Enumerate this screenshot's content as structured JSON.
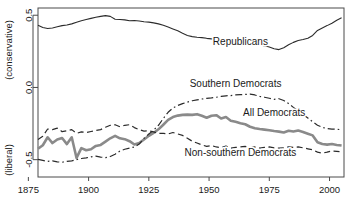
{
  "chart_data": {
    "type": "line",
    "title": "",
    "xlabel": "",
    "ylabel": "",
    "y_axis_top_label": "(conservative)",
    "y_axis_bottom_label": "(liberal)",
    "xlim": [
      1879,
      2006
    ],
    "ylim": [
      -0.62,
      0.55
    ],
    "grid": false,
    "legend_position": "inline-annotations",
    "xticks": [
      1875,
      1900,
      1925,
      1950,
      1975,
      2000
    ],
    "xtick_labels": [
      "1875",
      "1900",
      "1925",
      "1950",
      "1975",
      "2000"
    ],
    "yticks": [
      0.5,
      0.0,
      -0.5
    ],
    "ytick_labels": [
      "0.5",
      "0.0",
      "-0.5"
    ],
    "series": [
      {
        "name": "Republicans",
        "label": "Republicans",
        "style": "solid",
        "color": "#2b2b2b",
        "width": 1.1,
        "label_x": 1963,
        "label_y": 0.295,
        "x": [
          1879,
          1881,
          1883,
          1885,
          1887,
          1889,
          1891,
          1893,
          1895,
          1897,
          1899,
          1901,
          1903,
          1905,
          1907,
          1909,
          1911,
          1913,
          1915,
          1917,
          1919,
          1921,
          1923,
          1925,
          1927,
          1929,
          1931,
          1933,
          1935,
          1937,
          1939,
          1941,
          1943,
          1945,
          1947,
          1949,
          1951,
          1953,
          1955,
          1957,
          1959,
          1961,
          1963,
          1965,
          1967,
          1969,
          1971,
          1973,
          1975,
          1977,
          1979,
          1981,
          1983,
          1985,
          1987,
          1989,
          1991,
          1993,
          1995,
          1997,
          1999,
          2001,
          2003,
          2005
        ],
        "y": [
          0.43,
          0.415,
          0.408,
          0.412,
          0.42,
          0.428,
          0.432,
          0.44,
          0.452,
          0.462,
          0.47,
          0.478,
          0.486,
          0.492,
          0.497,
          0.492,
          0.472,
          0.47,
          0.468,
          0.462,
          0.463,
          0.46,
          0.455,
          0.452,
          0.447,
          0.44,
          0.43,
          0.418,
          0.405,
          0.392,
          0.375,
          0.36,
          0.352,
          0.348,
          0.345,
          0.34,
          0.336,
          0.332,
          0.33,
          0.328,
          0.326,
          0.322,
          0.318,
          0.312,
          0.305,
          0.3,
          0.295,
          0.288,
          0.28,
          0.268,
          0.262,
          0.275,
          0.295,
          0.312,
          0.325,
          0.332,
          0.34,
          0.36,
          0.395,
          0.412,
          0.428,
          0.445,
          0.465,
          0.482
        ]
      },
      {
        "name": "All Democrats",
        "label": "All Democrats",
        "style": "solid",
        "color": "#8a8a8a",
        "width": 2.6,
        "label_x": 1977,
        "label_y": -0.195,
        "x": [
          1879,
          1881,
          1883,
          1885,
          1887,
          1889,
          1891,
          1893,
          1895,
          1897,
          1899,
          1901,
          1903,
          1905,
          1907,
          1909,
          1911,
          1913,
          1915,
          1917,
          1919,
          1921,
          1923,
          1925,
          1927,
          1929,
          1931,
          1933,
          1935,
          1937,
          1939,
          1941,
          1943,
          1945,
          1947,
          1949,
          1951,
          1953,
          1955,
          1957,
          1959,
          1961,
          1963,
          1965,
          1967,
          1969,
          1971,
          1973,
          1975,
          1977,
          1979,
          1981,
          1983,
          1985,
          1987,
          1989,
          1991,
          1993,
          1995,
          1997,
          1999,
          2001,
          2003,
          2005
        ],
        "y": [
          -0.425,
          -0.4,
          -0.345,
          -0.385,
          -0.36,
          -0.35,
          -0.392,
          -0.345,
          -0.488,
          -0.42,
          -0.435,
          -0.428,
          -0.405,
          -0.398,
          -0.375,
          -0.352,
          -0.335,
          -0.352,
          -0.358,
          -0.372,
          -0.395,
          -0.385,
          -0.36,
          -0.335,
          -0.315,
          -0.29,
          -0.258,
          -0.225,
          -0.205,
          -0.195,
          -0.19,
          -0.188,
          -0.19,
          -0.185,
          -0.196,
          -0.21,
          -0.196,
          -0.192,
          -0.215,
          -0.205,
          -0.23,
          -0.238,
          -0.248,
          -0.255,
          -0.272,
          -0.282,
          -0.288,
          -0.292,
          -0.296,
          -0.302,
          -0.306,
          -0.312,
          -0.3,
          -0.305,
          -0.298,
          -0.308,
          -0.32,
          -0.332,
          -0.38,
          -0.392,
          -0.396,
          -0.392,
          -0.398,
          -0.402
        ]
      },
      {
        "name": "Non-southern Democrats",
        "label": "Non-southern Democrats",
        "style": "dashed",
        "color": "#2b2b2b",
        "width": 1.2,
        "label_x": 1963,
        "label_y": -0.472,
        "x": [
          1879,
          1881,
          1883,
          1885,
          1887,
          1889,
          1891,
          1893,
          1895,
          1897,
          1899,
          1901,
          1903,
          1905,
          1907,
          1909,
          1911,
          1913,
          1915,
          1917,
          1919,
          1921,
          1923,
          1925,
          1927,
          1929,
          1931,
          1933,
          1935,
          1937,
          1939,
          1941,
          1943,
          1945,
          1947,
          1949,
          1951,
          1953,
          1955,
          1957,
          1959,
          1961,
          1963,
          1965,
          1967,
          1969,
          1971,
          1973,
          1975,
          1977,
          1979,
          1981,
          1983,
          1985,
          1987,
          1989,
          1991,
          1993,
          1995,
          1997,
          1999,
          2001,
          2003,
          2005
        ],
        "y": [
          -0.36,
          -0.338,
          -0.288,
          -0.292,
          -0.282,
          -0.306,
          -0.3,
          -0.292,
          -0.318,
          -0.308,
          -0.312,
          -0.305,
          -0.298,
          -0.292,
          -0.276,
          -0.262,
          -0.258,
          -0.272,
          -0.262,
          -0.258,
          -0.278,
          -0.292,
          -0.302,
          -0.3,
          -0.308,
          -0.318,
          -0.318,
          -0.322,
          -0.312,
          -0.322,
          -0.332,
          -0.352,
          -0.372,
          -0.385,
          -0.398,
          -0.408,
          -0.402,
          -0.412,
          -0.418,
          -0.405,
          -0.42,
          -0.415,
          -0.412,
          -0.408,
          -0.418,
          -0.412,
          -0.42,
          -0.415,
          -0.412,
          -0.418,
          -0.42,
          -0.418,
          -0.412,
          -0.415,
          -0.412,
          -0.418,
          -0.425,
          -0.432,
          -0.448,
          -0.455,
          -0.448,
          -0.44,
          -0.442,
          -0.445
        ]
      },
      {
        "name": "Southern Democrats",
        "label": "Southern Democrats",
        "style": "dashdot",
        "color": "#2b2b2b",
        "width": 1.2,
        "label_x": 1961,
        "label_y": 0.005,
        "x": [
          1879,
          1881,
          1883,
          1885,
          1887,
          1889,
          1891,
          1893,
          1895,
          1897,
          1899,
          1901,
          1903,
          1905,
          1907,
          1909,
          1911,
          1913,
          1915,
          1917,
          1919,
          1921,
          1923,
          1925,
          1927,
          1929,
          1931,
          1933,
          1935,
          1937,
          1939,
          1941,
          1943,
          1945,
          1947,
          1949,
          1951,
          1953,
          1955,
          1957,
          1959,
          1961,
          1963,
          1965,
          1967,
          1969,
          1971,
          1973,
          1975,
          1977,
          1979,
          1981,
          1983,
          1985,
          1987,
          1989,
          1991,
          1993,
          1995,
          1997,
          1999,
          2001,
          2003,
          2005
        ],
        "y": [
          -0.498,
          -0.505,
          -0.512,
          -0.508,
          -0.515,
          -0.518,
          -0.512,
          -0.508,
          -0.5,
          -0.492,
          -0.488,
          -0.48,
          -0.476,
          -0.482,
          -0.486,
          -0.478,
          -0.462,
          -0.44,
          -0.428,
          -0.42,
          -0.412,
          -0.392,
          -0.352,
          -0.322,
          -0.296,
          -0.262,
          -0.215,
          -0.172,
          -0.142,
          -0.125,
          -0.112,
          -0.102,
          -0.092,
          -0.086,
          -0.08,
          -0.075,
          -0.072,
          -0.068,
          -0.062,
          -0.058,
          -0.056,
          -0.052,
          -0.05,
          -0.048,
          -0.046,
          -0.052,
          -0.062,
          -0.068,
          -0.075,
          -0.082,
          -0.078,
          -0.09,
          -0.112,
          -0.138,
          -0.162,
          -0.188,
          -0.212,
          -0.238,
          -0.262,
          -0.276,
          -0.285,
          -0.288,
          -0.29,
          -0.292
        ]
      }
    ]
  }
}
